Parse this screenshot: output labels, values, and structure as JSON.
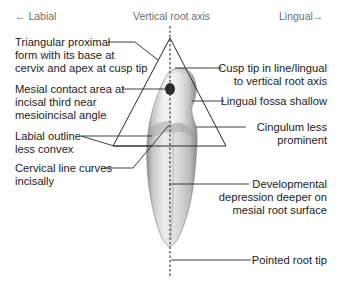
{
  "header": {
    "left": "← Labial",
    "center": "Vertical root axis",
    "right": "Lingual→"
  },
  "labels_left": [
    {
      "id": "triangular",
      "lines": [
        "Triangular proximal",
        "form with its base at",
        "cervix and apex at cusp tip"
      ]
    },
    {
      "id": "mesial_contact",
      "lines": [
        "Mesial contact area at",
        "incisal third near",
        "mesioincisal angle"
      ]
    },
    {
      "id": "labial_outline",
      "lines": [
        "Labial outline",
        "less convex"
      ]
    },
    {
      "id": "cervical_line",
      "lines": [
        "Cervical line curves",
        "incisally"
      ]
    }
  ],
  "labels_right": [
    {
      "id": "cusp_tip",
      "lines": [
        "Cusp tip in line/lingual",
        "to vertical root axis"
      ]
    },
    {
      "id": "lingual_fossa",
      "lines": [
        "Lingual fossa shallow"
      ]
    },
    {
      "id": "cingulum",
      "lines": [
        "Cingulum less",
        "prominent"
      ]
    },
    {
      "id": "developmental_depression",
      "lines": [
        "Developmental",
        "depression deeper on",
        "mesial root surface"
      ]
    },
    {
      "id": "root_tip",
      "lines": [
        "Pointed root tip"
      ]
    }
  ],
  "colors": {
    "text": "#1c1c1c",
    "header_text": "#6f6f6f",
    "line": "#2a2a2a",
    "tooth_light": "#e9e9e9",
    "tooth_mid": "#c4c4c4",
    "tooth_dark": "#8a8a8a",
    "contact_spot": "#2b2b2b"
  }
}
